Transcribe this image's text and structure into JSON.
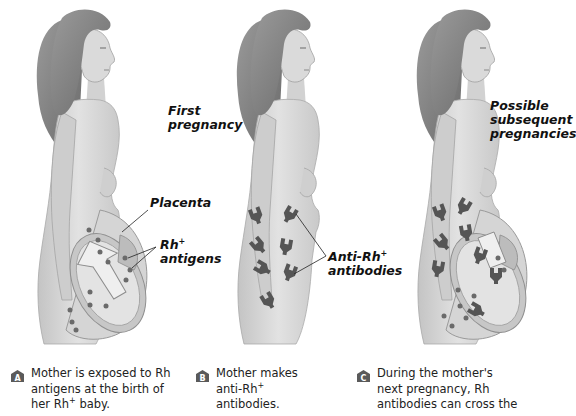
{
  "figure": {
    "panels": [
      {
        "id": "A",
        "heading_line1": "First",
        "heading_line2": "pregnancy",
        "labels": {
          "placenta": "Placenta",
          "rh_line1": "Rh",
          "rh_sup": "+",
          "rh_line2": "antigens"
        },
        "caption": {
          "badge": "A",
          "line1": "Mother is exposed to Rh",
          "line2": "antigens at the birth of",
          "line3_pre": "her Rh",
          "line3_sup": "+",
          "line3_post": " baby."
        }
      },
      {
        "id": "B",
        "labels": {
          "anti_line1": "Anti-Rh",
          "anti_sup": "+",
          "anti_line2": "antibodies"
        },
        "caption": {
          "badge": "B",
          "line1": "Mother makes",
          "line2_pre": "anti-Rh",
          "line2_sup": "+",
          "line3": "antibodies."
        }
      },
      {
        "id": "C",
        "heading_line1": "Possible",
        "heading_line2": "subsequent",
        "heading_line3": "pregnancies",
        "caption": {
          "badge": "C",
          "line1": "During the mother's",
          "line2": "next pregnancy, Rh",
          "line3": "antibodies can cross the"
        }
      }
    ],
    "colors": {
      "skin": "#d9d9d9",
      "skin_shade": "#b8b8b8",
      "hair": "#8a8a8a",
      "hair_dark": "#6f6f6f",
      "antigen_dot": "#6a6a6a",
      "antibody": "#555555",
      "badge_bg": "#5a5a5a",
      "arrow_fill": "#ececec"
    }
  }
}
